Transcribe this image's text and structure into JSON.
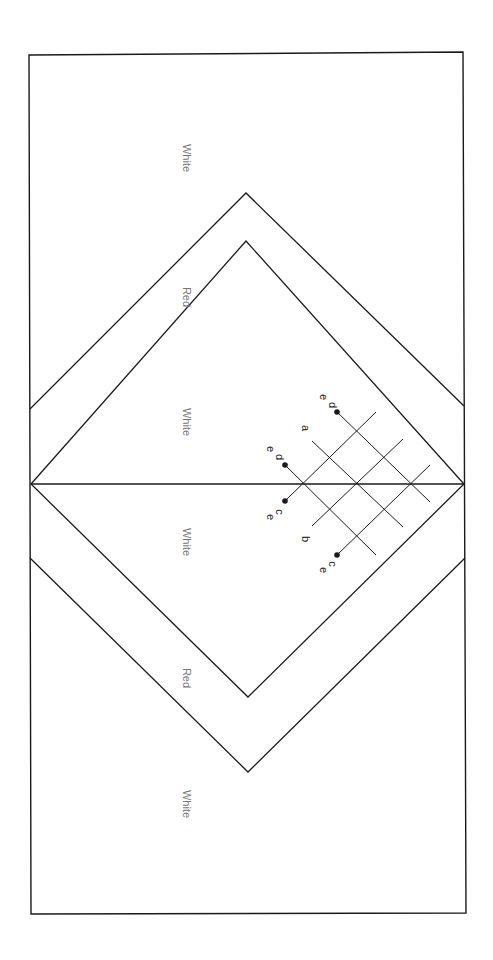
{
  "diagram": {
    "zone_labels": [
      {
        "text": "White",
        "x": 183,
        "y": 158
      },
      {
        "text": "Red",
        "x": 183,
        "y": 297
      },
      {
        "text": "White",
        "x": 183,
        "y": 422
      },
      {
        "text": "White",
        "x": 183,
        "y": 542
      },
      {
        "text": "Red",
        "x": 183,
        "y": 678
      },
      {
        "text": "White",
        "x": 183,
        "y": 804
      }
    ],
    "point_labels": [
      {
        "text": "e",
        "x": 320,
        "y": 397
      },
      {
        "text": "d",
        "x": 329,
        "y": 405
      },
      {
        "text": "a",
        "x": 302,
        "y": 428
      },
      {
        "text": "e",
        "x": 267,
        "y": 449
      },
      {
        "text": "d",
        "x": 276,
        "y": 457
      },
      {
        "text": "c",
        "x": 276,
        "y": 512
      },
      {
        "text": "e",
        "x": 267,
        "y": 517
      },
      {
        "text": "b",
        "x": 302,
        "y": 539
      },
      {
        "text": "c",
        "x": 329,
        "y": 564
      },
      {
        "text": "e",
        "x": 320,
        "y": 570
      }
    ],
    "colors": {
      "line": "#1a1a1a",
      "zone_text": "#777777",
      "label_text": "#222222",
      "background": "#ffffff"
    }
  }
}
